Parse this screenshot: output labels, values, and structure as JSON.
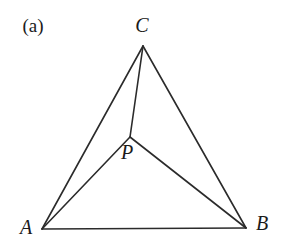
{
  "figure": {
    "panel_label": "(a)",
    "caption_position": {
      "x": 33,
      "y": 25
    },
    "background_color": "#ffffff",
    "stroke_color": "#2b2b2b",
    "stroke_width": 1.6,
    "width": 282,
    "height": 252
  },
  "chart_data": {
    "type": "diagram",
    "title": "(a)",
    "points": [
      {
        "name": "A",
        "label": "A",
        "x": 42,
        "y": 229,
        "label_x": 26,
        "label_y": 227
      },
      {
        "name": "B",
        "label": "B",
        "x": 246,
        "y": 228,
        "label_x": 262,
        "label_y": 223
      },
      {
        "name": "C",
        "label": "C",
        "x": 143,
        "y": 46,
        "label_x": 142,
        "label_y": 25
      },
      {
        "name": "P",
        "label": "P",
        "x": 130,
        "y": 137,
        "label_x": 127,
        "label_y": 152
      }
    ],
    "segments": [
      {
        "name": "AB",
        "from": "A",
        "to": "B",
        "x1": 42,
        "y1": 229,
        "x2": 246,
        "y2": 228
      },
      {
        "name": "AC",
        "from": "A",
        "to": "C",
        "x1": 42,
        "y1": 229,
        "x2": 143,
        "y2": 46
      },
      {
        "name": "BC",
        "from": "B",
        "to": "C",
        "x1": 246,
        "y1": 228,
        "x2": 143,
        "y2": 46
      },
      {
        "name": "AP",
        "from": "A",
        "to": "P",
        "x1": 42,
        "y1": 229,
        "x2": 130,
        "y2": 137
      },
      {
        "name": "BP",
        "from": "B",
        "to": "P",
        "x1": 246,
        "y1": 228,
        "x2": 130,
        "y2": 137
      },
      {
        "name": "CP",
        "from": "C",
        "to": "P",
        "x1": 143,
        "y1": 46,
        "x2": 130,
        "y2": 137
      }
    ]
  }
}
